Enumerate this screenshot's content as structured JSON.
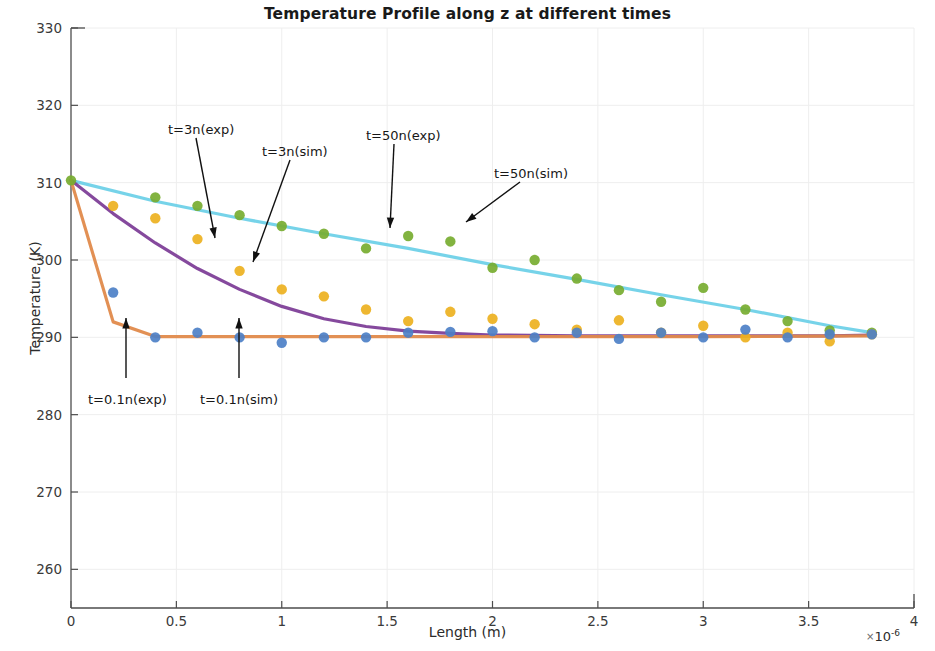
{
  "chart": {
    "title": "Temperature Profile along z at different times",
    "xlabel": "Length (m)",
    "ylabel": "Temperature (K)",
    "x_exponent_prefix": "×",
    "x_exponent_base": "10",
    "x_exponent_power": "-6",
    "yticks": [
      "260",
      "270",
      "280",
      "290",
      "300",
      "310",
      "320",
      "330"
    ],
    "xticks": [
      "0",
      "0.5",
      "1",
      "1.5",
      "2",
      "2.5",
      "3",
      "3.5",
      "4"
    ],
    "annotations": [
      {
        "name": "annot-t3n-exp",
        "text": "t=3n(exp)",
        "x": 168,
        "y": 122
      },
      {
        "name": "annot-t3n-sim",
        "text": "t=3n(sim)",
        "x": 262,
        "y": 144
      },
      {
        "name": "annot-t50n-exp",
        "text": "t=50n(exp)",
        "x": 366,
        "y": 128
      },
      {
        "name": "annot-t50n-sim",
        "text": "t=50n(sim)",
        "x": 494,
        "y": 166
      },
      {
        "name": "annot-t01n-exp",
        "text": "t=0.1n(exp)",
        "x": 88,
        "y": 392
      },
      {
        "name": "annot-t01n-sim",
        "text": "t=0.1n(sim)",
        "x": 200,
        "y": 392
      }
    ],
    "colors": {
      "sim_50n_line": "#6FD1E8",
      "sim_3n_line": "#7E3F98",
      "sim_01n_line": "#E08A4B",
      "exp_50n_marker": "#77AC30",
      "exp_3n_marker": "#EDB120",
      "exp_01n_marker": "#4D80C7",
      "axis": "#4d4d4d",
      "grid": "#eeeeee",
      "text": "#2b2b2b"
    }
  },
  "chart_data": {
    "type": "scatter",
    "title": "Temperature Profile along z at different times",
    "xlabel": "Length (m)",
    "ylabel": "Temperature (K)",
    "x_scale_factor": "1e-6",
    "xlim": [
      0,
      4
    ],
    "ylim": [
      255,
      330
    ],
    "xticks": [
      0,
      0.5,
      1,
      1.5,
      2,
      2.5,
      3,
      3.5,
      4
    ],
    "yticks": [
      260,
      270,
      280,
      290,
      300,
      310,
      320,
      330
    ],
    "grid": true,
    "legend": "annotations (no legend box)",
    "series": [
      {
        "name": "t=50n(sim)",
        "type": "line",
        "color": "#6FD1E8",
        "x": [
          0,
          0.4,
          0.8,
          1.2,
          1.6,
          2.0,
          2.4,
          2.8,
          3.2,
          3.6,
          3.8
        ],
        "y": [
          310.3,
          307.6,
          305.4,
          303.4,
          301.5,
          299.4,
          297.5,
          295.5,
          293.6,
          291.5,
          290.6
        ]
      },
      {
        "name": "t=3n(sim)",
        "type": "line",
        "color": "#7E3F98",
        "x": [
          0,
          0.2,
          0.4,
          0.6,
          0.8,
          1.0,
          1.2,
          1.4,
          1.6,
          1.8,
          2.0,
          2.4,
          2.8,
          3.2,
          3.6,
          3.8
        ],
        "y": [
          310.3,
          306.0,
          302.2,
          298.9,
          296.2,
          294.0,
          292.4,
          291.4,
          290.8,
          290.5,
          290.3,
          290.2,
          290.2,
          290.2,
          290.2,
          290.3
        ]
      },
      {
        "name": "t=0.1n(sim)",
        "type": "line",
        "color": "#E08A4B",
        "x": [
          0,
          0.2,
          0.4,
          1.0,
          2.0,
          3.0,
          3.8
        ],
        "y": [
          310.3,
          292.0,
          290.1,
          290.1,
          290.1,
          290.1,
          290.2
        ]
      },
      {
        "name": "t=50n(exp)",
        "type": "scatter",
        "color": "#77AC30",
        "x": [
          0,
          0.4,
          0.6,
          0.8,
          1.0,
          1.2,
          1.4,
          1.6,
          1.8,
          2.0,
          2.2,
          2.4,
          2.6,
          2.8,
          3.0,
          3.2,
          3.4,
          3.6,
          3.8
        ],
        "y": [
          310.3,
          308.1,
          307.0,
          305.8,
          304.4,
          303.4,
          301.5,
          303.1,
          302.4,
          299.0,
          300.0,
          297.6,
          296.1,
          294.6,
          296.4,
          293.6,
          292.1,
          290.9,
          290.6
        ]
      },
      {
        "name": "t=3n(exp)",
        "type": "scatter",
        "color": "#EDB120",
        "x": [
          0.2,
          0.4,
          0.6,
          0.8,
          1.0,
          1.2,
          1.4,
          1.6,
          1.8,
          2.0,
          2.2,
          2.4,
          2.6,
          2.8,
          3.0,
          3.2,
          3.4,
          3.6,
          3.8
        ],
        "y": [
          307.0,
          305.4,
          302.7,
          298.6,
          296.2,
          295.3,
          293.6,
          292.1,
          293.3,
          292.4,
          291.7,
          291.0,
          292.2,
          290.6,
          291.5,
          290.0,
          290.6,
          289.5,
          290.4
        ]
      },
      {
        "name": "t=0.1n(exp)",
        "type": "scatter",
        "color": "#4D80C7",
        "x": [
          0.2,
          0.4,
          0.6,
          0.8,
          1.0,
          1.2,
          1.4,
          1.6,
          1.8,
          2.0,
          2.2,
          2.4,
          2.6,
          2.8,
          3.0,
          3.2,
          3.4,
          3.6,
          3.8
        ],
        "y": [
          295.8,
          290.0,
          290.6,
          290.0,
          289.3,
          290.0,
          290.0,
          290.6,
          290.7,
          290.8,
          290.0,
          290.6,
          289.8,
          290.6,
          290.0,
          291.0,
          290.0,
          290.4,
          290.4
        ]
      }
    ]
  }
}
